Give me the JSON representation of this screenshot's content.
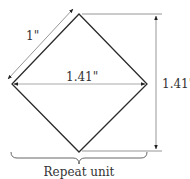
{
  "diagram": {
    "labels": {
      "side": "1\"",
      "width": "1.41\"",
      "height": "1.41\"",
      "caption": "Repeat unit"
    },
    "colors": {
      "shape_stroke": "#2a2a2a",
      "dimension_stroke": "#8a8a8a",
      "text": "#333333"
    }
  }
}
